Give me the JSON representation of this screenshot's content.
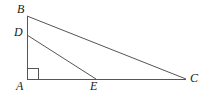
{
  "figure": {
    "kind": "geometry-diagram",
    "background_color": "#ffffff",
    "stroke_color": "#555555",
    "label_color": "#1a1a1a",
    "canvas": {
      "width": 205,
      "height": 96
    },
    "points": [
      {
        "id": "B",
        "label": "B",
        "x": 27,
        "y": 16,
        "label_x": 17,
        "label_y": 3
      },
      {
        "id": "D",
        "label": "D",
        "x": 27,
        "y": 35,
        "label_x": 14,
        "label_y": 26
      },
      {
        "id": "A",
        "label": "A",
        "x": 27,
        "y": 79,
        "label_x": 16,
        "label_y": 80
      },
      {
        "id": "E",
        "label": "E",
        "x": 96,
        "y": 79,
        "label_x": 90,
        "label_y": 80
      },
      {
        "id": "C",
        "label": "C",
        "x": 186,
        "y": 79,
        "label_x": 190,
        "label_y": 72
      }
    ],
    "segments": [
      {
        "id": "AB",
        "name": "segment-ab",
        "x1": 27,
        "y1": 16,
        "x2": 27,
        "y2": 79
      },
      {
        "id": "AC",
        "name": "segment-ac",
        "x1": 27,
        "y1": 79,
        "x2": 186,
        "y2": 79
      },
      {
        "id": "BC",
        "name": "segment-bc",
        "x1": 27,
        "y1": 16,
        "x2": 186,
        "y2": 79
      },
      {
        "id": "DE",
        "name": "segment-de",
        "x1": 27,
        "y1": 35,
        "x2": 96,
        "y2": 79
      }
    ],
    "right_angle": {
      "at": "A",
      "x": 28,
      "y": 68,
      "size": 10
    }
  }
}
